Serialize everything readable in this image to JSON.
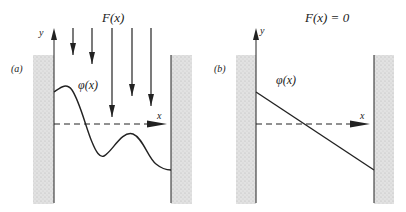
{
  "figure": {
    "panel_a": {
      "label": "(a)",
      "force_label": "F(x)",
      "y_axis_label": "y",
      "x_axis_label": "x",
      "curve_label": "φ(x)",
      "force_arrow_count": 5
    },
    "panel_b": {
      "label": "(b)",
      "force_label": "F(x) = 0",
      "y_axis_label": "y",
      "x_axis_label": "x",
      "curve_label": "φ(x)"
    },
    "colors": {
      "ink": "#222222",
      "wall_fill": "#d8d8d8"
    }
  }
}
